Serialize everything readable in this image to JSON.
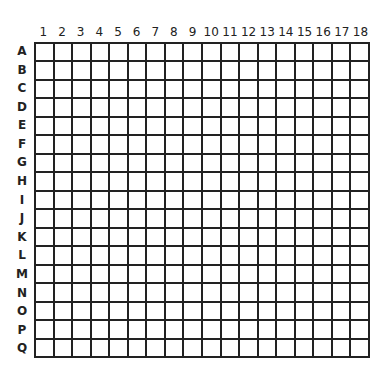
{
  "grid": {
    "columns": [
      "1",
      "2",
      "3",
      "4",
      "5",
      "6",
      "7",
      "8",
      "9",
      "10",
      "11",
      "12",
      "13",
      "14",
      "15",
      "16",
      "17",
      "18"
    ],
    "rows": [
      "A",
      "B",
      "C",
      "D",
      "E",
      "F",
      "G",
      "H",
      "I",
      "J",
      "K",
      "L",
      "M",
      "N",
      "O",
      "P",
      "Q"
    ],
    "line_color": "#222222",
    "cell_color": "#ffffff"
  }
}
